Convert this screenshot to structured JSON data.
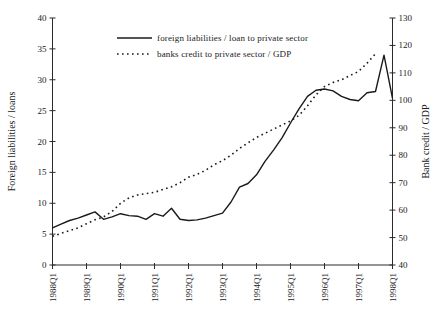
{
  "colors": {
    "line": "#1a1a1a",
    "axis": "#2b2b2b",
    "text": "#1a1a1a",
    "background": "#ffffff"
  },
  "chart_data": {
    "type": "line",
    "title": "",
    "n_points": 41,
    "x_tick_labels": [
      "1988Q1",
      "1989Q1",
      "1990Q1",
      "1991Q1",
      "1992Q1",
      "1993Q1",
      "1994Q1",
      "1995Q1",
      "1996Q1",
      "1997Q1",
      "1998Q1"
    ],
    "quarters_per_tick": 4,
    "grid": "off",
    "legend_position": "top-center",
    "left_axis": {
      "label": "Foreign liabilities / loans",
      "min": 0,
      "max": 40,
      "step": 5,
      "ticks": [
        "0",
        "5",
        "10",
        "15",
        "20",
        "25",
        "30",
        "35",
        "40"
      ]
    },
    "right_axis": {
      "label": "Bank credit / GDP",
      "min": 40,
      "max": 130,
      "step": 10,
      "ticks": [
        "40",
        "50",
        "60",
        "70",
        "80",
        "90",
        "100",
        "110",
        "120",
        "130"
      ]
    },
    "series": [
      {
        "name": "foreign liabilities / loan to private sector",
        "axis": "left",
        "style": "solid",
        "start_index": 0,
        "values": [
          6.0,
          6.6,
          7.2,
          7.6,
          8.1,
          8.6,
          7.4,
          7.8,
          8.3,
          8.0,
          7.9,
          7.4,
          8.3,
          7.9,
          9.2,
          7.4,
          7.2,
          7.3,
          7.6,
          8.0,
          8.4,
          10.2,
          12.6,
          13.2,
          14.6,
          16.8,
          18.6,
          20.6,
          23.0,
          25.3,
          27.3,
          28.3,
          28.5,
          28.2,
          27.3,
          26.8,
          26.6,
          27.9,
          28.1,
          34.0,
          27.0
        ]
      },
      {
        "name": "banks credit to private sector / GDP",
        "axis": "right",
        "style": "dotted",
        "start_index": 0,
        "values": [
          50.5,
          51.5,
          52.5,
          53.5,
          55.0,
          56.5,
          57.5,
          59.5,
          62.5,
          64.5,
          65.5,
          66.0,
          66.5,
          67.5,
          68.5,
          70.0,
          72.0,
          73.0,
          74.5,
          76.5,
          78.0,
          80.0,
          82.5,
          84.5,
          86.5,
          88.0,
          89.5,
          91.0,
          92.5,
          94.5,
          98.0,
          102.0,
          105.0,
          106.5,
          107.5,
          109.0,
          110.5,
          113.5,
          117.0
        ]
      }
    ]
  }
}
